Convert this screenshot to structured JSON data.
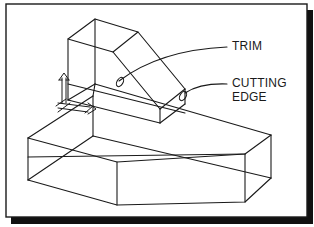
{
  "figure": {
    "type": "isometric wireframe CAD drawing",
    "labels": {
      "trim": "TRIM",
      "cutting_edge_line1": "CUTTING",
      "cutting_edge_line2": "EDGE"
    },
    "annotations": [
      {
        "id": "trim",
        "text": "TRIM",
        "points_to": "sloped edge of upper block"
      },
      {
        "id": "cutting-edge",
        "text": "CUTTING EDGE",
        "points_to": "vertical edge of upper block"
      }
    ],
    "objects": [
      {
        "id": "upper-block",
        "description": "wedge-shaped block with sloped roof"
      },
      {
        "id": "base-slab",
        "description": "pentagonal prism base slab"
      },
      {
        "id": "ucs-icon",
        "description": "user coordinate system arrows icon"
      }
    ],
    "colors": {
      "line": "#1a1a1a",
      "background": "#ffffff",
      "shadow": "#111111"
    }
  }
}
